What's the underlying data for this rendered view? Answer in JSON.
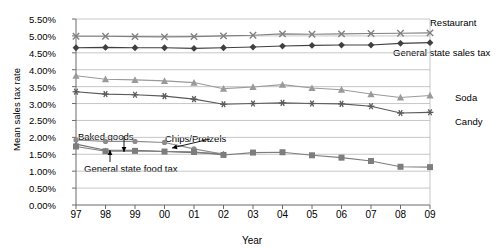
{
  "chart_data": {
    "type": "line",
    "title": "",
    "xlabel": "Year",
    "ylabel": "Mean sales tax rate",
    "x": [
      "97",
      "98",
      "99",
      "00",
      "01",
      "02",
      "03",
      "04",
      "05",
      "06",
      "07",
      "08",
      "09"
    ],
    "xlim": [
      0,
      12
    ],
    "ylim": [
      0.0,
      5.5
    ],
    "ytick_labels": [
      "0.00%",
      "0.50%",
      "1.00%",
      "1.50%",
      "2.00%",
      "2.50%",
      "3.00%",
      "3.50%",
      "4.00%",
      "4.50%",
      "5.00%",
      "5.50%"
    ],
    "ytick_values": [
      0.0,
      0.5,
      1.0,
      1.5,
      2.0,
      2.5,
      3.0,
      3.5,
      4.0,
      4.5,
      5.0,
      5.5
    ],
    "grid": "horizontal",
    "legend_position": "right-inline-labels",
    "series": [
      {
        "name": "Restaurant",
        "marker": "x",
        "color": "#808080",
        "label_x": 430,
        "label_y": 17,
        "values": [
          4.99,
          4.99,
          4.98,
          4.97,
          4.98,
          5.0,
          5.02,
          5.06,
          5.05,
          5.06,
          5.07,
          5.08,
          5.09
        ]
      },
      {
        "name": "General state sales tax",
        "marker": "diamond",
        "color": "#404040",
        "label_x": 393,
        "label_y": 47,
        "values": [
          4.65,
          4.66,
          4.65,
          4.65,
          4.63,
          4.65,
          4.67,
          4.7,
          4.72,
          4.73,
          4.73,
          4.78,
          4.8
        ]
      },
      {
        "name": "Soda",
        "marker": "triangle",
        "color": "#9a9a9a",
        "label_x": 455,
        "label_y": 92,
        "values": [
          3.82,
          3.72,
          3.7,
          3.67,
          3.62,
          3.44,
          3.49,
          3.56,
          3.46,
          3.41,
          3.28,
          3.18,
          3.24
        ]
      },
      {
        "name": "Candy",
        "marker": "asterisk",
        "color": "#5a5a5a",
        "label_x": 455,
        "label_y": 116,
        "values": [
          3.35,
          3.28,
          3.26,
          3.22,
          3.13,
          2.98,
          3.0,
          3.02,
          3.0,
          2.99,
          2.92,
          2.72,
          2.74
        ]
      },
      {
        "name": "Baked goods",
        "marker": "triangle-small",
        "color": "#707070",
        "label_x": 0,
        "label_y": 0,
        "values": [
          1.8,
          1.62,
          1.62,
          1.58,
          1.55,
          1.52,
          null,
          null,
          null,
          null,
          null,
          null,
          null
        ]
      },
      {
        "name": "Chips/Pretzels",
        "marker": "circle",
        "color": "#8c8c8c",
        "label_x": 0,
        "label_y": 0,
        "values": [
          1.92,
          1.88,
          1.88,
          1.85,
          1.66,
          1.5,
          null,
          null,
          null,
          null,
          null,
          null,
          null
        ]
      },
      {
        "name": "General state food tax",
        "marker": "square",
        "color": "#7d7d7d",
        "label_x": 0,
        "label_y": 0,
        "values": [
          1.73,
          1.59,
          1.6,
          1.58,
          1.57,
          1.48,
          1.55,
          1.56,
          1.47,
          1.4,
          1.3,
          1.13,
          1.12
        ]
      }
    ],
    "annotations": [
      {
        "text": "Baked goods",
        "x": 78,
        "y": 131,
        "arrow_from_x": 124,
        "arrow_from_y": 136,
        "arrow_to_x": 124,
        "arrow_to_y": 152
      },
      {
        "text": "Chips/Pretzels",
        "x": 165,
        "y": 133,
        "arrow_from_x": 210,
        "arrow_from_y": 139,
        "arrow_to_x": 172,
        "arrow_to_y": 148
      },
      {
        "text": "General state food tax",
        "x": 84,
        "y": 163,
        "arrow_from_x": 110,
        "arrow_from_y": 162,
        "arrow_to_x": 110,
        "arrow_to_y": 150
      }
    ]
  }
}
